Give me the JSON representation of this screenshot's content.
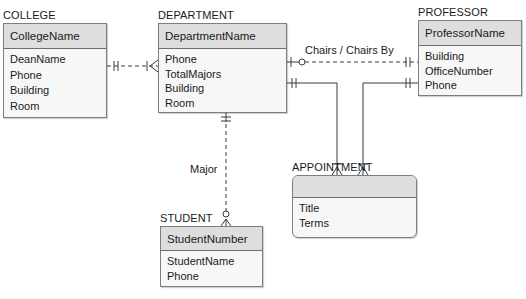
{
  "entities": {
    "college": {
      "title": "COLLEGE",
      "key": "CollegeName",
      "attributes": [
        "DeanName",
        "Phone",
        "Building",
        "Room"
      ]
    },
    "department": {
      "title": "DEPARTMENT",
      "key": "DepartmentName",
      "attributes": [
        "Phone",
        "TotalMajors",
        "Building",
        "Room"
      ]
    },
    "professor": {
      "title": "PROFESSOR",
      "key": "ProfessorName",
      "attributes": [
        "Building",
        "OfficeNumber",
        "Phone"
      ]
    },
    "appointment": {
      "title": "APPOINTMENT",
      "key": "",
      "attributes": [
        "Title",
        "Terms"
      ]
    },
    "student": {
      "title": "STUDENT",
      "key": "StudentNumber",
      "attributes": [
        "StudentName",
        "Phone"
      ]
    }
  },
  "relationships": {
    "college_department": {
      "label": "",
      "from": "COLLEGE",
      "to": "DEPARTMENT",
      "from_cardinality": "exactly-one",
      "to_cardinality": "one-or-many",
      "identifying": false
    },
    "chairs": {
      "label": "Chairs / Chairs By",
      "from": "DEPARTMENT",
      "to": "PROFESSOR",
      "from_cardinality": "zero-or-one",
      "to_cardinality": "exactly-one",
      "identifying": false
    },
    "department_appointment": {
      "label": "",
      "from": "DEPARTMENT",
      "to": "APPOINTMENT",
      "from_cardinality": "exactly-one",
      "to_cardinality": "one-or-many",
      "identifying": true
    },
    "professor_appointment": {
      "label": "",
      "from": "PROFESSOR",
      "to": "APPOINTMENT",
      "from_cardinality": "exactly-one",
      "to_cardinality": "one-or-many",
      "identifying": true
    },
    "major": {
      "label": "Major",
      "from": "DEPARTMENT",
      "to": "STUDENT",
      "from_cardinality": "exactly-one",
      "to_cardinality": "zero-or-many",
      "identifying": false
    }
  },
  "colors": {
    "line": "#3a3a3a",
    "border": "#7d7d7d",
    "header_fill": "#dedede",
    "body_fill": "#f7f7f7"
  }
}
